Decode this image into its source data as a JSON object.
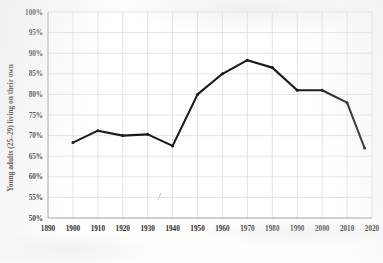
{
  "chart_data": {
    "type": "line",
    "title": "",
    "subtitle": "",
    "xlabel": "",
    "ylabel": "Young adults (25–29) living on their own",
    "xlim": [
      1890,
      2020
    ],
    "ylim": [
      50,
      100
    ],
    "grid": true,
    "legend": null,
    "y_tick_labels": [
      "50%",
      "55%",
      "60%",
      "65%",
      "70%",
      "75%",
      "80%",
      "85%",
      "90%",
      "95%",
      "100%"
    ],
    "y_ticks": [
      50,
      55,
      60,
      65,
      70,
      75,
      80,
      85,
      90,
      95,
      100
    ],
    "x_tick_labels": [
      "1890",
      "1900",
      "1910",
      "1920",
      "1930",
      "1940",
      "1950",
      "1960",
      "1970",
      "1980",
      "1990",
      "2000",
      "2010",
      "2020"
    ],
    "x_ticks": [
      1890,
      1900,
      1910,
      1920,
      1930,
      1940,
      1950,
      1960,
      1970,
      1980,
      1990,
      2000,
      2010,
      2020
    ],
    "series": [
      {
        "name": "Young adults (25–29) living on their own",
        "color": "#1a1a1a",
        "x": [
          1900,
          1910,
          1920,
          1930,
          1940,
          1950,
          1960,
          1970,
          1980,
          1990,
          2000,
          2010,
          2017
        ],
        "values": [
          68.3,
          71.2,
          70.0,
          70.3,
          67.5,
          80.0,
          85.0,
          88.3,
          86.5,
          81.0,
          81.0,
          78.0,
          67.0
        ]
      }
    ]
  },
  "figure": {
    "background_color": "#fdfdfc",
    "axis_color": "#9a9c9f",
    "grid_color": "#d7d9dd",
    "text_color": "#2a2a2a"
  }
}
